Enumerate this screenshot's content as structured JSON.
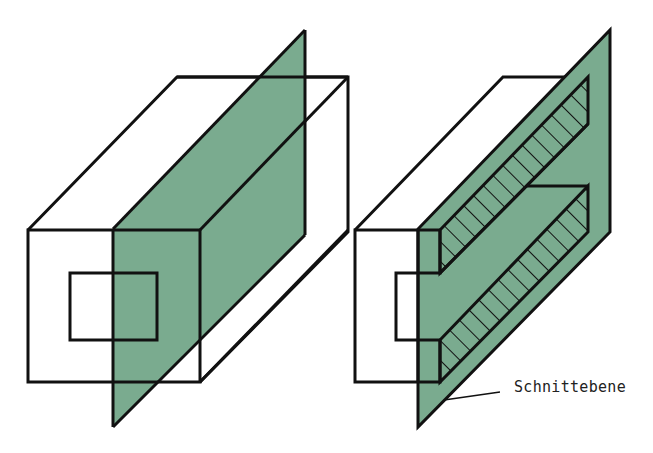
{
  "figure": {
    "caption_partial": "",
    "colors": {
      "plane_fill": "#7aab8f",
      "stroke": "#111111",
      "background": "#ffffff"
    },
    "left_view": {
      "description": "Hollow square tube intersected by a vertical cutting plane (uncut view)"
    },
    "right_view": {
      "description": "Same tube cut along the plane, showing hatched section surfaces"
    },
    "labels": {
      "cutting_plane": "Schnittebene"
    }
  }
}
